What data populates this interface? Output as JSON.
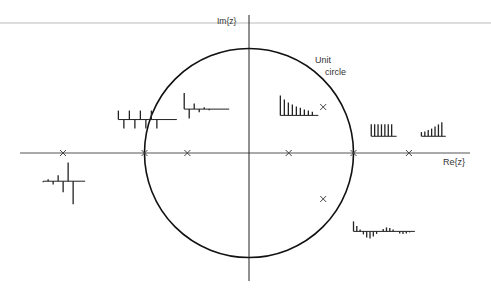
{
  "diagram": {
    "axes": {
      "real_label": "Re{z}",
      "imag_label": "Im{z}"
    },
    "unit_circle": {
      "label_line1": "Unit",
      "label_line2": "circle",
      "radius": 1
    },
    "poles": [
      {
        "id": "p-neg-1-78",
        "re": -1.78,
        "im": 0
      },
      {
        "id": "p-neg-1",
        "re": -1.0,
        "im": 0
      },
      {
        "id": "p-neg-0-59",
        "re": -0.59,
        "im": 0
      },
      {
        "id": "p-0-38",
        "re": 0.38,
        "im": 0
      },
      {
        "id": "p-1",
        "re": 1.0,
        "im": 0
      },
      {
        "id": "p-1-53",
        "re": 1.53,
        "im": 0
      },
      {
        "id": "p-complex-upper",
        "re": 0.71,
        "im": 0.44
      },
      {
        "id": "p-complex-lower",
        "re": 0.71,
        "im": -0.44
      }
    ],
    "impulse_responses": [
      {
        "id": "resp-pole-neg-1",
        "description": "alternating constant amplitude",
        "anchor_re": -1.25,
        "anchor_im": 0.32,
        "samples": [
          1,
          -1,
          1,
          -1,
          1,
          -1,
          1,
          -1
        ]
      },
      {
        "id": "resp-pole-neg-0-59",
        "description": "alternating decaying",
        "anchor_re": -0.62,
        "anchor_im": 0.42,
        "samples": [
          1,
          -0.59,
          0.35,
          -0.2,
          0.12,
          -0.07
        ]
      },
      {
        "id": "resp-pole-neg-1-78",
        "description": "alternating growing",
        "anchor_re": -1.97,
        "anchor_im": -0.27,
        "samples": [
          -0.1,
          0.18,
          -0.3,
          0.55,
          -1.0,
          1.7,
          -2.1
        ]
      },
      {
        "id": "resp-pole-0-38",
        "description": "decaying",
        "anchor_re": 0.3,
        "anchor_im": 0.36,
        "samples": [
          1,
          0.8,
          0.65,
          0.55,
          0.45,
          0.38,
          0.3,
          0.24,
          0.18
        ]
      },
      {
        "id": "resp-pole-1",
        "description": "constant",
        "anchor_re": 1.17,
        "anchor_im": 0.16,
        "samples": [
          1,
          1,
          1,
          1,
          1,
          1,
          1
        ]
      },
      {
        "id": "resp-pole-1-53",
        "description": "growing",
        "anchor_re": 1.65,
        "anchor_im": 0.16,
        "samples": [
          0.3,
          0.35,
          0.45,
          0.55,
          0.7,
          0.85,
          1.0
        ]
      },
      {
        "id": "resp-complex",
        "description": "damped oscillation",
        "anchor_re": 1.0,
        "anchor_im": -0.75,
        "samples": [
          1,
          0.55,
          0.2,
          -0.3,
          -0.6,
          -0.7,
          -0.5,
          -0.25,
          0,
          0.25,
          0.4,
          0.35,
          0.2,
          0,
          -0.2,
          -0.25,
          -0.2,
          -0.1,
          0
        ]
      }
    ]
  }
}
